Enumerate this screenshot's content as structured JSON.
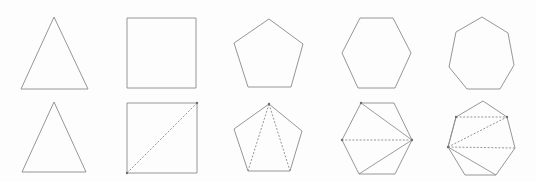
{
  "figure": {
    "background_color": "#fdfdfd",
    "stroke_color": "#8a8a8a",
    "width": 536,
    "height": 181,
    "rows": [
      {
        "row_name": "plain-polygons",
        "description": "Regular polygons drawn without diagonals"
      },
      {
        "row_name": "triangulated-polygons",
        "description": "Same polygons with fan triangulation diagonals drawn from one vertex"
      }
    ],
    "columns": [
      {
        "label": "triangle",
        "sides": 3,
        "triangles": 1,
        "diagonals": 0
      },
      {
        "label": "square",
        "sides": 4,
        "triangles": 2,
        "diagonals": 1
      },
      {
        "label": "pentagon",
        "sides": 5,
        "triangles": 3,
        "diagonals": 2
      },
      {
        "label": "hexagon",
        "sides": 6,
        "triangles": 4,
        "diagonals": 3
      },
      {
        "label": "heptagon",
        "sides": 7,
        "triangles": 5,
        "diagonals": 4
      }
    ]
  },
  "chart_data": {
    "type": "diagram",
    "shapes": [
      {
        "name": "triangle-plain",
        "row": "top",
        "sides": 3,
        "points": [
          [
            54,
            17
          ],
          [
            88,
            89
          ],
          [
            21,
            89
          ]
        ],
        "diagonals": [],
        "marked_vertices": []
      },
      {
        "name": "square-plain",
        "row": "top",
        "sides": 4,
        "points": [
          [
            127,
            18
          ],
          [
            196,
            18
          ],
          [
            196,
            88
          ],
          [
            127,
            88
          ]
        ],
        "diagonals": [],
        "marked_vertices": []
      },
      {
        "name": "pentagon-plain",
        "row": "top",
        "sides": 5,
        "points": [
          [
            269,
            19
          ],
          [
            303,
            44
          ],
          [
            291,
            87
          ],
          [
            248,
            87
          ],
          [
            234,
            43
          ]
        ],
        "diagonals": [],
        "marked_vertices": []
      },
      {
        "name": "hexagon-plain",
        "row": "top",
        "sides": 6,
        "points": [
          [
            360,
            18
          ],
          [
            393,
            18
          ],
          [
            411,
            53
          ],
          [
            395,
            88
          ],
          [
            358,
            88
          ],
          [
            342,
            53
          ]
        ],
        "diagonals": [],
        "marked_vertices": []
      },
      {
        "name": "heptagon-plain",
        "row": "top",
        "sides": 7,
        "points": [
          [
            482,
            17
          ],
          [
            508,
            33
          ],
          [
            514,
            65
          ],
          [
            500,
            89
          ],
          [
            467,
            89
          ],
          [
            449,
            67
          ],
          [
            456,
            32
          ]
        ],
        "diagonals": [],
        "marked_vertices": []
      },
      {
        "name": "triangle-triangulated",
        "row": "bottom",
        "sides": 3,
        "points": [
          [
            54,
            102
          ],
          [
            86,
            172
          ],
          [
            22,
            172
          ]
        ],
        "diagonals": [],
        "marked_vertices": []
      },
      {
        "name": "square-triangulated",
        "row": "bottom",
        "sides": 4,
        "points": [
          [
            127,
            103
          ],
          [
            197,
            103
          ],
          [
            197,
            173
          ],
          [
            127,
            173
          ]
        ],
        "diagonals": [
          {
            "from": [
              127,
              173
            ],
            "to": [
              197,
              103
            ],
            "style": "dashed"
          }
        ],
        "marked_vertices": [
          [
            197,
            103
          ],
          [
            127,
            173
          ]
        ]
      },
      {
        "name": "pentagon-triangulated",
        "row": "bottom",
        "sides": 5,
        "points": [
          [
            269,
            104
          ],
          [
            302,
            131
          ],
          [
            290,
            171
          ],
          [
            248,
            171
          ],
          [
            234,
            129
          ]
        ],
        "diagonals": [
          {
            "from": [
              269,
              104
            ],
            "to": [
              290,
              171
            ],
            "style": "dashed"
          },
          {
            "from": [
              269,
              104
            ],
            "to": [
              248,
              171
            ],
            "style": "dashed"
          }
        ],
        "marked_vertices": [
          [
            269,
            104
          ]
        ]
      },
      {
        "name": "hexagon-triangulated",
        "row": "bottom",
        "sides": 6,
        "points": [
          [
            361,
            103
          ],
          [
            394,
            103
          ],
          [
            412,
            140
          ],
          [
            395,
            174
          ],
          [
            359,
            174
          ],
          [
            342,
            140
          ]
        ],
        "diagonals": [
          {
            "from": [
              412,
              140
            ],
            "to": [
              361,
              103
            ],
            "style": "solid"
          },
          {
            "from": [
              412,
              140
            ],
            "to": [
              342,
              140
            ],
            "style": "dashed"
          },
          {
            "from": [
              412,
              140
            ],
            "to": [
              359,
              174
            ],
            "style": "solid"
          }
        ],
        "marked_vertices": [
          [
            412,
            140
          ],
          [
            361,
            103
          ],
          [
            342,
            140
          ]
        ]
      },
      {
        "name": "heptagon-triangulated",
        "row": "bottom",
        "sides": 7,
        "points": [
          [
            483,
            101
          ],
          [
            507,
            117
          ],
          [
            515,
            148
          ],
          [
            496,
            175
          ],
          [
            465,
            175
          ],
          [
            448,
            147
          ],
          [
            456,
            117
          ]
        ],
        "diagonals": [
          {
            "from": [
              448,
              147
            ],
            "to": [
              456,
              117
            ],
            "style": "solid"
          },
          {
            "from": [
              456,
              117
            ],
            "to": [
              507,
              117
            ],
            "style": "dashed"
          },
          {
            "from": [
              448,
              147
            ],
            "to": [
              507,
              117
            ],
            "style": "dashed"
          },
          {
            "from": [
              448,
              147
            ],
            "to": [
              515,
              148
            ],
            "style": "dashed"
          },
          {
            "from": [
              448,
              147
            ],
            "to": [
              496,
              175
            ],
            "style": "solid"
          }
        ],
        "marked_vertices": [
          [
            448,
            147
          ],
          [
            507,
            117
          ],
          [
            456,
            117
          ]
        ]
      }
    ]
  }
}
